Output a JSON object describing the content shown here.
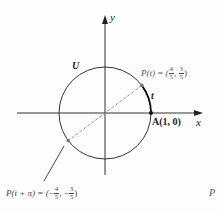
{
  "figure": {
    "axes": {
      "x_label": "x",
      "y_label": "y"
    },
    "circle_label": "U",
    "arc_label": "t",
    "point_A": {
      "label": "A(1, 0)"
    },
    "point_P": {
      "label_prefix": "P(t) = (",
      "x_num": "4",
      "x_den": "5",
      "y_num": "3",
      "y_den": "5",
      "suffix": ")"
    },
    "point_P_pi": {
      "label_prefix": "P(t + π) = (",
      "x_sign": "−",
      "x_num": "4",
      "x_den": "5",
      "y_sign": "−",
      "y_num": "3",
      "y_den": "5",
      "suffix": ")"
    },
    "corner_glyph_bottom_right": "P",
    "colors": {
      "stroke": "#333333",
      "dashed": "#888888",
      "arc_highlight": "#111111"
    }
  }
}
